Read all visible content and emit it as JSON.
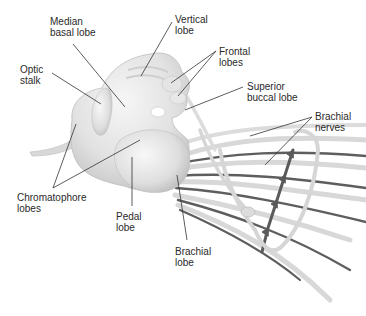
{
  "figure": {
    "colors": {
      "background": "#ffffff",
      "brain_fill": "#e3e3e3",
      "brain_highlight": "#f4f4f4",
      "brain_shadow": "#c2c2c2",
      "nerve_light": "#d9d9d9",
      "nerve_dark": "#5a5a5a",
      "leader_line": "#333333",
      "label_text": "#2a2a2a"
    },
    "labels": [
      {
        "id": "median-basal-lobe",
        "line1": "Median",
        "line2": "basal lobe",
        "x": 50,
        "y": 16
      },
      {
        "id": "vertical-lobe",
        "line1": "Vertical",
        "line2": "lobe",
        "x": 175,
        "y": 14
      },
      {
        "id": "frontal-lobes",
        "line1": "Frontal",
        "line2": "lobes",
        "x": 219,
        "y": 46
      },
      {
        "id": "optic-stalk",
        "line1": "Optic",
        "line2": "stalk",
        "x": 20,
        "y": 64
      },
      {
        "id": "superior-buccal-lobe",
        "line1": "Superior",
        "line2": "buccal lobe",
        "x": 247,
        "y": 81
      },
      {
        "id": "brachial-nerves",
        "line1": "Brachial",
        "line2": "nerves",
        "x": 315,
        "y": 111
      },
      {
        "id": "chromatophore-lobes",
        "line1": "Chromatophore",
        "line2": "lobes",
        "x": 17,
        "y": 192
      },
      {
        "id": "pedal-lobe",
        "line1": "Pedal",
        "line2": "lobe",
        "x": 116,
        "y": 211
      },
      {
        "id": "brachial-lobe",
        "line1": "Brachial",
        "line2": "lobe",
        "x": 175,
        "y": 246
      }
    ]
  }
}
